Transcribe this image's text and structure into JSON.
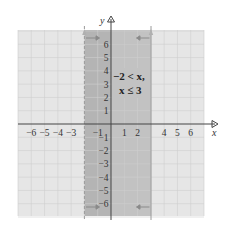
{
  "figure": {
    "type": "coordinate-plane",
    "x_axis_label": "x",
    "y_axis_label": "y",
    "x_range": [
      -7,
      7
    ],
    "y_range": [
      -7,
      7
    ],
    "x_ticks": [
      {
        "value": -6,
        "label": "−6"
      },
      {
        "value": -5,
        "label": "−5"
      },
      {
        "value": -4,
        "label": "−4"
      },
      {
        "value": -3,
        "label": "−3"
      },
      {
        "value": -1,
        "label": "−1"
      },
      {
        "value": 1,
        "label": "1"
      },
      {
        "value": 2,
        "label": "2"
      },
      {
        "value": 4,
        "label": "4"
      },
      {
        "value": 5,
        "label": "5"
      },
      {
        "value": 6,
        "label": "6"
      }
    ],
    "y_ticks": [
      {
        "value": 6,
        "label": "6"
      },
      {
        "value": 5,
        "label": "5"
      },
      {
        "value": 4,
        "label": "4"
      },
      {
        "value": 3,
        "label": "3"
      },
      {
        "value": 2,
        "label": "2"
      },
      {
        "value": 1,
        "label": "1"
      },
      {
        "value": -1,
        "label": "−1"
      },
      {
        "value": -2,
        "label": "−2"
      },
      {
        "value": -3,
        "label": "−3"
      },
      {
        "value": -4,
        "label": "−4"
      },
      {
        "value": -5,
        "label": "−5"
      },
      {
        "value": -6,
        "label": "−6"
      }
    ],
    "region": {
      "left_bound": -2,
      "left_inclusive": false,
      "left_line_style": "dashed",
      "right_bound": 3,
      "right_inclusive": true,
      "right_line_style": "solid"
    },
    "annotation_line1": "−2 < x,",
    "annotation_line2": "x ≤ 3",
    "colors": {
      "background_grid_fill": "#e6e6e6",
      "grid_line": "#c8c8c8",
      "shaded_region": "#bdbdbd",
      "shaded_region_left_band": "#a9a9a9",
      "axis": "#444444",
      "arrow_marker": "#8a8a8a"
    }
  }
}
